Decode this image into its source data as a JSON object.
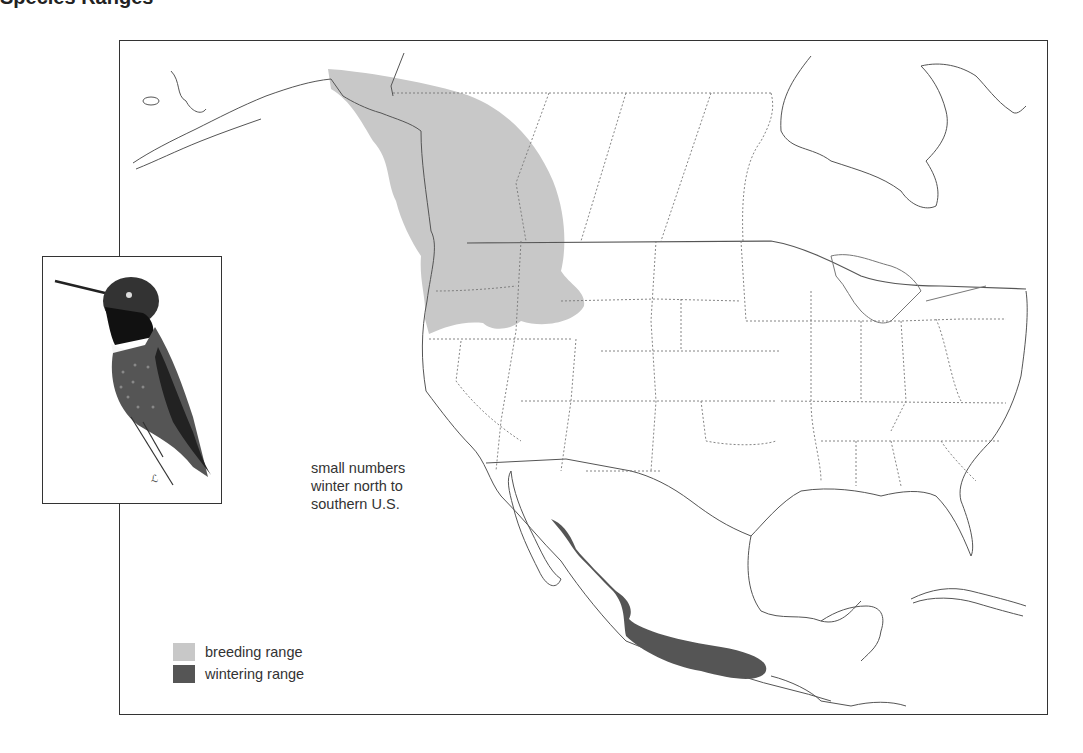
{
  "title": "Species Ranges",
  "annotation": {
    "lines": [
      "small numbers",
      "winter north to",
      "southern U.S."
    ]
  },
  "legend": {
    "items": [
      {
        "label": "breeding range",
        "color": "#c8c8c8"
      },
      {
        "label": "wintering range",
        "color": "#555555"
      }
    ]
  },
  "inset": {
    "subject": "hummingbird-illustration"
  },
  "colors": {
    "frame": "#333333",
    "coastline": "#555555",
    "state_border": "#777777",
    "breeding": "#c8c8c8",
    "wintering": "#555555"
  }
}
